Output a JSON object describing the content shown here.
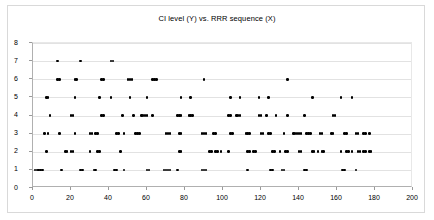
{
  "chart": {
    "title": "CI level (Y) vs. RRR sequence (X)"
  },
  "chart_data": {
    "type": "scatter",
    "title": "CI level (Y) vs. RRR sequence (X)",
    "xlabel": "",
    "ylabel": "",
    "xlim": [
      0,
      200
    ],
    "ylim": [
      0,
      8
    ],
    "xticks": [
      0,
      20,
      40,
      60,
      80,
      100,
      120,
      140,
      160,
      180,
      200
    ],
    "yticks": [
      0,
      1,
      2,
      3,
      4,
      5,
      6,
      7,
      8
    ],
    "grid": "horizontal",
    "legend": "none",
    "marker": "filled-diamond",
    "marker_color": "#000000",
    "series": [
      {
        "name": "CI level",
        "x": [
          1,
          2,
          3,
          4,
          5,
          15,
          25,
          26,
          32,
          33,
          43,
          44,
          48,
          60,
          61,
          69,
          70,
          71,
          72,
          76,
          89,
          90,
          91,
          113,
          125,
          126,
          131,
          132,
          143,
          144,
          163,
          164,
          170
        ],
        "y": [
          1,
          1,
          1,
          1,
          1,
          1,
          1,
          1,
          1,
          1,
          1,
          1,
          1,
          1,
          1,
          1,
          1,
          1,
          1,
          1,
          1,
          1,
          1,
          1,
          1,
          1,
          1,
          1,
          1,
          1,
          1,
          1,
          1
        ]
      },
      {
        "name": "CI level",
        "x": [
          7,
          17,
          18,
          20,
          21,
          30,
          34,
          35,
          46,
          77,
          78,
          93,
          94,
          96,
          97,
          99,
          103,
          113,
          114,
          116,
          117,
          126,
          127,
          130,
          133,
          134,
          140,
          141,
          147,
          148,
          150,
          152,
          153,
          162,
          165,
          166,
          168,
          171,
          172,
          174,
          175,
          177,
          178
        ],
        "y": [
          2,
          2,
          2,
          2,
          2,
          2,
          2,
          2,
          2,
          2,
          2,
          2,
          2,
          2,
          2,
          2,
          2,
          2,
          2,
          2,
          2,
          2,
          2,
          2,
          2,
          2,
          2,
          2,
          2,
          2,
          2,
          2,
          2,
          2,
          2,
          2,
          2,
          2,
          2,
          2,
          2,
          2,
          2
        ]
      },
      {
        "name": "CI level",
        "x": [
          6,
          8,
          14,
          22,
          30,
          31,
          33,
          34,
          44,
          45,
          48,
          54,
          55,
          56,
          70,
          71,
          72,
          77,
          78,
          89,
          90,
          91,
          95,
          96,
          104,
          105,
          112,
          113,
          114,
          120,
          121,
          124,
          125,
          132,
          137,
          138,
          139,
          140,
          141,
          144,
          145,
          146,
          151,
          152,
          157,
          158,
          164,
          165,
          170,
          171,
          174,
          175,
          177
        ],
        "y": [
          3,
          3,
          3,
          3,
          3,
          3,
          3,
          3,
          3,
          3,
          3,
          3,
          3,
          3,
          3,
          3,
          3,
          3,
          3,
          3,
          3,
          3,
          3,
          3,
          3,
          3,
          3,
          3,
          3,
          3,
          3,
          3,
          3,
          3,
          3,
          3,
          3,
          3,
          3,
          3,
          3,
          3,
          3,
          3,
          3,
          3,
          3,
          3,
          3,
          3,
          3,
          3,
          3
        ]
      },
      {
        "name": "CI level",
        "x": [
          9,
          20,
          21,
          36,
          37,
          47,
          53,
          57,
          58,
          59,
          60,
          63,
          76,
          77,
          78,
          82,
          83,
          84,
          103,
          104,
          107,
          108,
          109,
          119,
          120,
          123,
          128,
          134,
          143,
          158,
          159
        ],
        "y": [
          4,
          4,
          4,
          4,
          4,
          4,
          4,
          4,
          4,
          4,
          4,
          4,
          4,
          4,
          4,
          4,
          4,
          4,
          4,
          4,
          4,
          4,
          4,
          4,
          4,
          4,
          4,
          4,
          4,
          4,
          4
        ]
      },
      {
        "name": "CI level",
        "x": [
          7,
          8,
          22,
          35,
          41,
          51,
          60,
          78,
          83,
          104,
          109,
          119,
          124,
          147,
          162,
          168
        ],
        "y": [
          5,
          5,
          5,
          5,
          5,
          5,
          5,
          5,
          5,
          5,
          5,
          5,
          5,
          5,
          5,
          5
        ]
      },
      {
        "name": "CI level",
        "x": [
          13,
          14,
          22,
          23,
          36,
          37,
          50,
          51,
          52,
          63,
          64,
          65,
          90,
          134
        ],
        "y": [
          6,
          6,
          6,
          6,
          6,
          6,
          6,
          6,
          6,
          6,
          6,
          6,
          6,
          6
        ]
      },
      {
        "name": "CI level",
        "x": [
          13,
          25,
          41,
          42
        ],
        "y": [
          7,
          7,
          7,
          7
        ]
      }
    ]
  }
}
